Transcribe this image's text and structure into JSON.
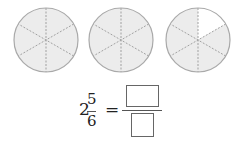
{
  "figure": {
    "circles": [
      {
        "cx": 46,
        "cy": 40,
        "r": 32,
        "parts": 6,
        "shaded": 6
      },
      {
        "cx": 121,
        "cy": 40,
        "r": 32,
        "parts": 6,
        "shaded": 6
      },
      {
        "cx": 198,
        "cy": 40,
        "r": 32,
        "parts": 6,
        "shaded": 5,
        "unshaded_sector": "top-right"
      }
    ],
    "colors": {
      "shade": "#ececec",
      "outline": "#a9a9a9",
      "divider": "#a0a0a0",
      "blank": "#ffffff"
    }
  },
  "equation": {
    "whole": "2",
    "numerator": "5",
    "denominator": "6",
    "equals": "=",
    "answer_numerator": "",
    "answer_denominator": ""
  }
}
